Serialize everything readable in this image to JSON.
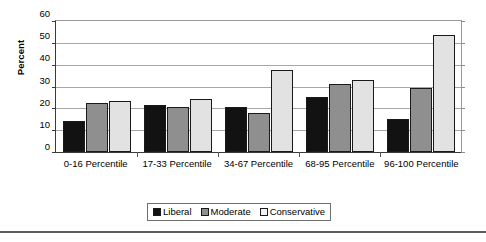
{
  "chart_data": {
    "type": "bar",
    "title": "",
    "xlabel": "",
    "ylabel": "Percent",
    "ylim": [
      0,
      60
    ],
    "yticks": [
      0,
      10,
      20,
      30,
      40,
      50,
      60
    ],
    "grid": true,
    "legend_position": "bottom",
    "categories": [
      "0-16 Percentile",
      "17-33 Percentile",
      "34-67 Percentile",
      "68-95 Percentile",
      "96-100 Percentile"
    ],
    "series": [
      {
        "name": "Liberal",
        "color": "#121212",
        "values": [
          14,
          21.5,
          20.5,
          25,
          15
        ]
      },
      {
        "name": "Moderate",
        "color": "#8f8f8f",
        "values": [
          22.5,
          20.5,
          18,
          31,
          29.5
        ]
      },
      {
        "name": "Conservative",
        "color": "#e2e2e2",
        "values": [
          23.5,
          24.5,
          37.5,
          33,
          53.5
        ]
      }
    ]
  },
  "axis": {
    "y_title": "Percent",
    "y_tick_labels": [
      "60",
      "50",
      "40",
      "30",
      "20",
      "10",
      "0"
    ]
  },
  "legend": {
    "items": [
      {
        "label": "Liberal"
      },
      {
        "label": "Moderate"
      },
      {
        "label": "Conservative"
      }
    ]
  }
}
